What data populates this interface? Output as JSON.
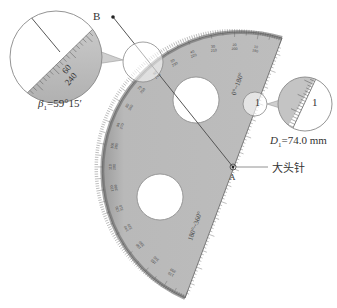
{
  "figure": {
    "point_b_label": "B",
    "point_a_label": "A",
    "pin_label": "大头针",
    "beta_label": "β",
    "beta_sub": "1",
    "beta_value": "=59°15′",
    "d_label": "D",
    "d_sub": "1",
    "d_value": "=74.0 mm",
    "small_circle_mark": "1",
    "zoom_circle_mark": "1",
    "scale_labels_top": [
      "60",
      "240"
    ],
    "straight_edge_top_label": "0°~180°",
    "straight_edge_bottom_label": "180°~360°",
    "arc_tick_labels": [
      {
        "top": "10",
        "bottom": "190"
      },
      {
        "top": "20",
        "bottom": "200"
      },
      {
        "top": "30",
        "bottom": "210"
      },
      {
        "top": "40",
        "bottom": "220"
      },
      {
        "top": "50",
        "bottom": "230"
      },
      {
        "top": "60",
        "bottom": "240"
      },
      {
        "top": "70",
        "bottom": "250"
      },
      {
        "top": "80",
        "bottom": "260"
      },
      {
        "top": "90",
        "bottom": "270"
      },
      {
        "top": "100",
        "bottom": "280"
      },
      {
        "top": "110",
        "bottom": "290"
      },
      {
        "top": "120",
        "bottom": "300"
      },
      {
        "top": "130",
        "bottom": "310"
      },
      {
        "top": "140",
        "bottom": "320"
      },
      {
        "top": "150",
        "bottom": "330"
      },
      {
        "top": "160",
        "bottom": "340"
      },
      {
        "top": "170",
        "bottom": "350"
      }
    ]
  },
  "colors": {
    "protractor_fill": "#b4b4b4",
    "protractor_edge": "#6e6e6e",
    "line": "#555555",
    "text": "#333333"
  }
}
